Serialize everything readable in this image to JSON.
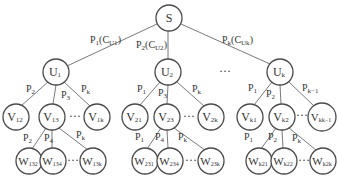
{
  "diagram": {
    "type": "tree",
    "root": {
      "id": "S",
      "label": "S",
      "sub": ""
    },
    "level1": [
      {
        "id": "U1",
        "label": "U",
        "sub": "1",
        "edge_label": "P",
        "edge_sub": "1",
        "edge_extra": "(C",
        "edge_extra_sub": "U1",
        "edge_close": ")"
      },
      {
        "id": "U2",
        "label": "U",
        "sub": "2",
        "edge_label": "P",
        "edge_sub": "2",
        "edge_extra": "(C",
        "edge_extra_sub": "U2",
        "edge_close": ")"
      },
      {
        "id": "Uk",
        "label": "U",
        "sub": "k",
        "edge_label": "P",
        "edge_sub": "k",
        "edge_extra": "(C",
        "edge_extra_sub": "Uk",
        "edge_close": ")"
      }
    ],
    "level1_ellipsis": "···",
    "level2": {
      "U1": [
        {
          "label": "V",
          "sub": "12",
          "edge_label": "P",
          "edge_sub": "2"
        },
        {
          "label": "V",
          "sub": "13",
          "edge_label": "P",
          "edge_sub": "3"
        },
        {
          "label": "V",
          "sub": "1k",
          "edge_label": "P",
          "edge_sub": "k"
        }
      ],
      "U2": [
        {
          "label": "V",
          "sub": "21",
          "edge_label": "P",
          "edge_sub": "1"
        },
        {
          "label": "V",
          "sub": "23",
          "edge_label": "P",
          "edge_sub": "3"
        },
        {
          "label": "V",
          "sub": "2k",
          "edge_label": "P",
          "edge_sub": "k"
        }
      ],
      "Uk": [
        {
          "label": "V",
          "sub": "k1",
          "edge_label": "P",
          "edge_sub": "1"
        },
        {
          "label": "V",
          "sub": "k2",
          "edge_label": "P",
          "edge_sub": "2"
        },
        {
          "label": "V",
          "sub": "kk−1",
          "edge_label": "P",
          "edge_sub": "k−1"
        }
      ]
    },
    "level3": {
      "V13": [
        {
          "label": "W",
          "sub": "132",
          "edge_label": "P",
          "edge_sub": "2"
        },
        {
          "label": "W",
          "sub": "134",
          "edge_label": "P",
          "edge_sub": "4"
        },
        {
          "label": "W",
          "sub": "13k",
          "edge_label": "P",
          "edge_sub": "k"
        }
      ],
      "V23": [
        {
          "label": "W",
          "sub": "231",
          "edge_label": "P",
          "edge_sub": "1"
        },
        {
          "label": "W",
          "sub": "234",
          "edge_label": "P",
          "edge_sub": "4"
        },
        {
          "label": "W",
          "sub": "23k",
          "edge_label": "P",
          "edge_sub": "k"
        }
      ],
      "Vk2": [
        {
          "label": "W",
          "sub": "k21",
          "edge_label": "P",
          "edge_sub": "1"
        },
        {
          "label": "W",
          "sub": "k22",
          "edge_label": "P",
          "edge_sub": "2"
        },
        {
          "label": "W",
          "sub": "k2k",
          "edge_label": "P",
          "edge_sub": "k"
        }
      ]
    },
    "ellipsis": "···"
  }
}
